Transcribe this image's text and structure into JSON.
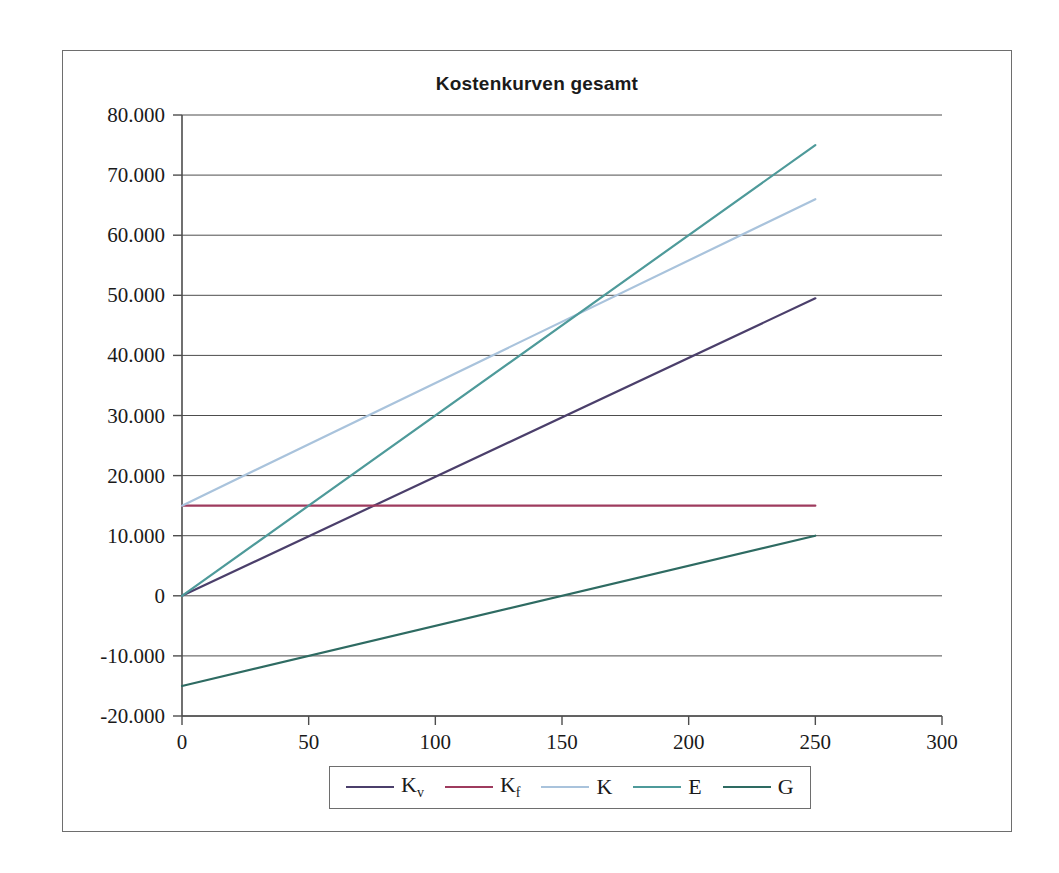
{
  "figure": {
    "title": "Kostenkurven gesamt"
  },
  "axes": {
    "y_tick_labels": [
      "80.000",
      "70.000",
      "60.000",
      "50.000",
      "40.000",
      "30.000",
      "20.000",
      "10.000",
      "0",
      "-10.000",
      "-20.000"
    ],
    "x_tick_labels": [
      "0",
      "50",
      "100",
      "150",
      "200",
      "250",
      "300"
    ]
  },
  "legend": {
    "entries": [
      {
        "key": "Kv",
        "label_main": "K",
        "label_sub": "v",
        "color": "#4b3f6b"
      },
      {
        "key": "Kf",
        "label_main": "K",
        "label_sub": "f",
        "color": "#9e3b5e"
      },
      {
        "key": "K",
        "label_main": "K",
        "label_sub": "",
        "color": "#a9c3dc"
      },
      {
        "key": "E",
        "label_main": "E",
        "label_sub": "",
        "color": "#4e9a9a"
      },
      {
        "key": "G",
        "label_main": "G",
        "label_sub": "",
        "color": "#2e6b62"
      }
    ]
  },
  "chart_data": {
    "type": "line",
    "title": "Kostenkurven gesamt",
    "xlabel": "",
    "ylabel": "",
    "xlim": [
      0,
      300
    ],
    "ylim": [
      -20000,
      80000
    ],
    "xticks": [
      0,
      50,
      100,
      150,
      200,
      250,
      300
    ],
    "yticks": [
      -20000,
      -10000,
      0,
      10000,
      20000,
      30000,
      40000,
      50000,
      60000,
      70000,
      80000
    ],
    "grid": "horizontal",
    "legend_position": "bottom",
    "x": [
      0,
      250
    ],
    "series": [
      {
        "name": "Kv",
        "label": "K_v",
        "color": "#4b3f6b",
        "values": [
          0,
          49500
        ]
      },
      {
        "name": "Kf",
        "label": "K_f",
        "color": "#9e3b5e",
        "values": [
          15000,
          15000
        ]
      },
      {
        "name": "K",
        "label": "K",
        "color": "#a9c3dc",
        "values": [
          15000,
          66000
        ]
      },
      {
        "name": "E",
        "label": "E",
        "color": "#4e9a9a",
        "values": [
          0,
          75000
        ]
      },
      {
        "name": "G",
        "label": "G",
        "color": "#2e6b62",
        "values": [
          -15000,
          10000
        ]
      }
    ],
    "annotations": [
      {
        "text": "break-even",
        "x": 150,
        "y": 0
      }
    ]
  }
}
